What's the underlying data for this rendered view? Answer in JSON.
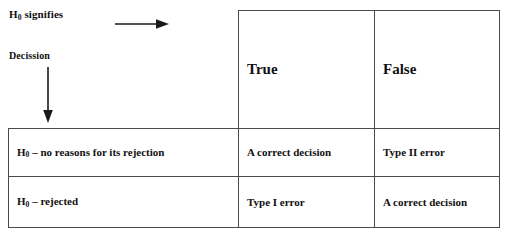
{
  "legend": {
    "row_axis_label_prefix": "H",
    "row_axis_label_sub": "0",
    "row_axis_label_suffix": " signifies",
    "column_axis_label": "Decission",
    "right_arrow_icon": "right-arrow-icon",
    "down_arrow_icon": "down-arrow-icon"
  },
  "table": {
    "column_headers": [
      {
        "label": "True"
      },
      {
        "label": "False"
      }
    ],
    "rows": [
      {
        "label_prefix": "H",
        "label_sub": "0",
        "label_suffix": " – no reasons for its rejection",
        "cells": [
          "A correct decision",
          "Type II error"
        ]
      },
      {
        "label_prefix": "H",
        "label_sub": "0",
        "label_suffix": " – rejected",
        "cells": [
          "Type I error",
          "A correct decision"
        ]
      }
    ]
  },
  "style": {
    "border_color": "#4a4a4a",
    "text_color": "#111111",
    "background": "#ffffff"
  }
}
